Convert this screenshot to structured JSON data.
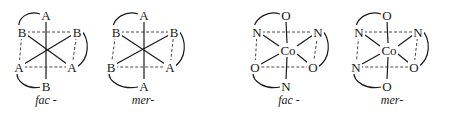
{
  "figures": [
    {
      "id": "fig1",
      "label": "fac -",
      "center_label": "",
      "atoms": {
        "top": "A",
        "upper_left": "B",
        "upper_right": "B",
        "lower_left": "A",
        "lower_right": "A",
        "bottom": "B"
      }
    },
    {
      "id": "fig2",
      "label": "mer-",
      "center_label": "",
      "atoms": {
        "top": "A",
        "upper_left": "B",
        "upper_right": "B",
        "lower_left": "B",
        "lower_right": "A",
        "bottom": "A"
      }
    },
    {
      "id": "fig3",
      "label": "fac -",
      "center_label": "Co",
      "atoms": {
        "top": "O",
        "upper_left": "N",
        "upper_right": "N",
        "lower_left": "O",
        "lower_right": "O",
        "bottom": "N"
      }
    },
    {
      "id": "fig4",
      "label": "mer-",
      "center_label": "Co",
      "atoms": {
        "top": "O",
        "upper_left": "N",
        "upper_right": "N",
        "lower_left": "N",
        "lower_right": "O",
        "bottom": "O"
      }
    }
  ]
}
